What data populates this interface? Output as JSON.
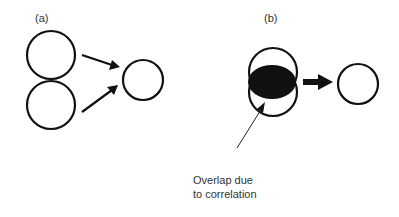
{
  "panels": {
    "a": {
      "label": "(a)"
    },
    "b": {
      "label": "(b)",
      "annotation": {
        "line1": "Overlap due",
        "line2": "to correlation"
      }
    }
  },
  "colors": {
    "stroke": "#111111",
    "fill": "#111111",
    "text": "#333333",
    "background": "#ffffff"
  }
}
